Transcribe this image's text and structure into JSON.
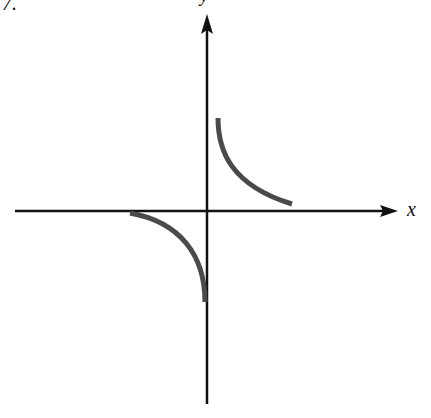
{
  "problem_number": "7.",
  "axes": {
    "x_label": "x",
    "y_label": "y",
    "origin": [
      207,
      211
    ],
    "x_axis": {
      "from": [
        15,
        211
      ],
      "to": [
        398,
        211
      ]
    },
    "y_axis": {
      "from": [
        207,
        404
      ],
      "to": [
        207,
        14
      ]
    }
  },
  "curves": [
    {
      "name": "upper-right-branch",
      "quadrant": "I",
      "path": "M218,118 C218,150 230,185 292,204",
      "color": "#4a4a4a"
    },
    {
      "name": "lower-left-branch",
      "quadrant": "III",
      "path": "M130,213 C180,222 205,255 205,302",
      "color": "#4a4a4a"
    }
  ],
  "colors": {
    "axis": "#111111",
    "curve": "#4a4a4a",
    "background": "#ffffff"
  }
}
